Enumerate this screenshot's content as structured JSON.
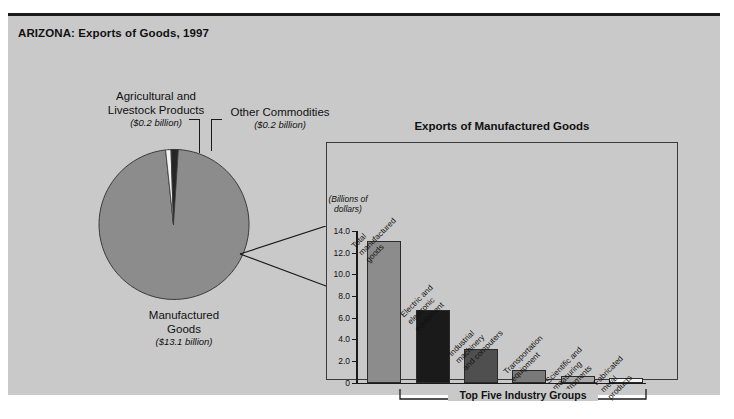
{
  "figure": {
    "title": "ARIZONA: Exports of Goods, 1997",
    "background_color": "#c9c9c9",
    "rule_color": "#1a1a1a"
  },
  "pie": {
    "slices": [
      {
        "name": "Manufactured Goods",
        "value_label": "($13.1 billion)",
        "value": 13.1,
        "color": "#8c8c8c"
      },
      {
        "name": "Agricultural and Livestock Products",
        "name_line1": "Agricultural and",
        "name_line2": "Livestock Products",
        "value_label": "($0.2 billion)",
        "value": 0.2,
        "color": "#f2f2f2"
      },
      {
        "name": "Other Commodities",
        "value_label": "($0.2 billion)",
        "value": 0.2,
        "color": "#262626"
      }
    ],
    "callouts": {
      "agricultural": {
        "line1": "Agricultural and",
        "line2": "Livestock Products",
        "value": "($0.2 billion)"
      },
      "other": {
        "line1": "Other Commodities",
        "value": "($0.2 billion)"
      },
      "manufactured": {
        "line1": "Manufactured",
        "line2": "Goods",
        "value": "($13.1 billion)"
      }
    }
  },
  "bar_panel": {
    "title": "Exports of Manufactured Goods",
    "units_line1": "(Billions of",
    "units_line2": "dollars)",
    "bracket_label": "Top Five Industry Groups"
  },
  "chart_data": {
    "type": "bar",
    "title": "Exports of Manufactured Goods",
    "xlabel": "Top Five Industry Groups",
    "ylabel": "(Billions of dollars)",
    "ylim": [
      0,
      14
    ],
    "yticks": [
      "0",
      "2.0",
      "4.0",
      "6.0",
      "8.0",
      "10.0",
      "12.0",
      "14.0"
    ],
    "ytick_values": [
      0,
      2,
      4,
      6,
      8,
      10,
      12,
      14
    ],
    "grid": false,
    "legend": "none",
    "categories": [
      "Total manufactured goods",
      "Electric and electronic equipment",
      "Industrial machinery and computers",
      "Transportation equipment",
      "Scientific and measuring instruments",
      "Fabricated metal products"
    ],
    "category_lines": [
      [
        "Total",
        "manufactured",
        "goods"
      ],
      [
        "Electric and",
        "electronic",
        "equipment"
      ],
      [
        "Industrial",
        "machinery",
        "and computers"
      ],
      [
        "Transportation",
        "equipment"
      ],
      [
        "Scientific and",
        "measuring",
        "instruments"
      ],
      [
        "Fabricated",
        "metal",
        "products"
      ]
    ],
    "values": [
      13.1,
      6.7,
      3.1,
      1.2,
      0.6,
      0.4
    ],
    "bar_colors": [
      "#8c8c8c",
      "#1a1a1a",
      "#4f4f4f",
      "#7a7a7a",
      "#a8a8a8",
      "#f4f4f4"
    ]
  }
}
